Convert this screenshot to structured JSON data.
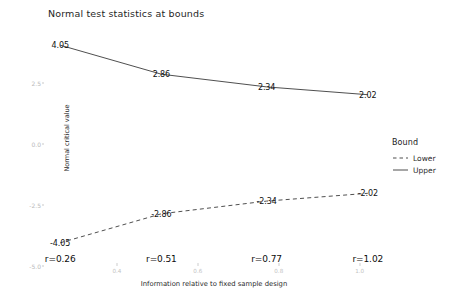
{
  "chart_data": {
    "type": "line",
    "title": "Normal test statistics at bounds",
    "xlabel": "Information relative to fixed sample design",
    "ylabel": "Normal critical value",
    "x": [
      0.26,
      0.51,
      0.77,
      1.02
    ],
    "xlim": [
      0.22,
      1.06
    ],
    "ylim": [
      -5.0,
      5.0
    ],
    "x_ticks": [
      "0.4",
      "0.6",
      "0.8",
      "1.0"
    ],
    "x_tick_values": [
      0.4,
      0.6,
      0.8,
      1.0
    ],
    "y_ticks": [
      "2.5",
      "0.0",
      "-2.5",
      "-5.0"
    ],
    "y_tick_values": [
      2.5,
      0.0,
      -2.5,
      -5.0
    ],
    "grid": false,
    "legend_position": "right",
    "series": [
      {
        "name": "Upper",
        "style": "solid",
        "color": "#3b3b3b",
        "values": [
          4.05,
          2.86,
          2.34,
          2.02
        ],
        "labels": [
          "4.05",
          "2.86",
          "2.34",
          "2.02"
        ]
      },
      {
        "name": "Lower",
        "style": "dashed",
        "color": "#3b3b3b",
        "values": [
          -4.05,
          -2.86,
          -2.34,
          -2.02
        ],
        "labels": [
          "-4.05",
          "-2.86",
          "-2.34",
          "-2.02"
        ]
      }
    ],
    "annotations": [
      "r=0.26",
      "r=0.51",
      "r=0.77",
      "r=1.02"
    ]
  },
  "legend": {
    "title": "Bound",
    "items": [
      {
        "label": "Lower"
      },
      {
        "label": "Upper"
      }
    ]
  }
}
